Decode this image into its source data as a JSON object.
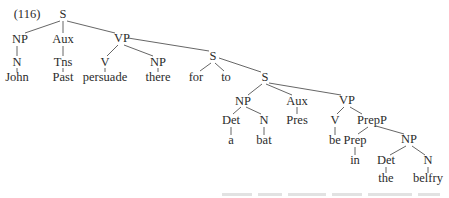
{
  "diagram": {
    "type": "syntax-tree",
    "example_number": "(116)",
    "nodes": [
      {
        "id": "s1",
        "label": "S",
        "x": 63,
        "y": 18
      },
      {
        "id": "np1",
        "label": "NP",
        "x": 20,
        "y": 43
      },
      {
        "id": "aux1",
        "label": "Aux",
        "x": 63,
        "y": 43
      },
      {
        "id": "vp1",
        "label": "VP",
        "x": 122,
        "y": 42
      },
      {
        "id": "n1",
        "label": "N",
        "x": 17,
        "y": 66
      },
      {
        "id": "tns1",
        "label": "Tns",
        "x": 63,
        "y": 66
      },
      {
        "id": "v1",
        "label": "V",
        "x": 105,
        "y": 66
      },
      {
        "id": "np2",
        "label": "NP",
        "x": 158,
        "y": 66
      },
      {
        "id": "s2",
        "label": "S",
        "x": 213,
        "y": 60
      },
      {
        "id": "w_john",
        "label": "John",
        "x": 17,
        "y": 81
      },
      {
        "id": "w_past",
        "label": "Past",
        "x": 63,
        "y": 81
      },
      {
        "id": "w_persuade",
        "label": "persuade",
        "x": 105,
        "y": 81
      },
      {
        "id": "w_there",
        "label": "there",
        "x": 158,
        "y": 81
      },
      {
        "id": "w_for",
        "label": "for",
        "x": 196,
        "y": 81
      },
      {
        "id": "w_to",
        "label": "to",
        "x": 226,
        "y": 81
      },
      {
        "id": "s3",
        "label": "S",
        "x": 265,
        "y": 81
      },
      {
        "id": "np3",
        "label": "NP",
        "x": 243,
        "y": 105
      },
      {
        "id": "aux2",
        "label": "Aux",
        "x": 297,
        "y": 105
      },
      {
        "id": "vp2",
        "label": "VP",
        "x": 347,
        "y": 104
      },
      {
        "id": "det1",
        "label": "Det",
        "x": 231,
        "y": 124
      },
      {
        "id": "n2",
        "label": "N",
        "x": 264,
        "y": 124
      },
      {
        "id": "w_pres",
        "label": "Pres",
        "x": 297,
        "y": 124
      },
      {
        "id": "v2",
        "label": "V",
        "x": 335,
        "y": 124
      },
      {
        "id": "prepp",
        "label": "PrepP",
        "x": 372,
        "y": 124
      },
      {
        "id": "w_a",
        "label": "a",
        "x": 231,
        "y": 144
      },
      {
        "id": "w_bat",
        "label": "bat",
        "x": 264,
        "y": 144
      },
      {
        "id": "w_be",
        "label": "be",
        "x": 335,
        "y": 144
      },
      {
        "id": "prep",
        "label": "Prep",
        "x": 355,
        "y": 144
      },
      {
        "id": "np4",
        "label": "NP",
        "x": 409,
        "y": 143
      },
      {
        "id": "w_in",
        "label": "in",
        "x": 355,
        "y": 164
      },
      {
        "id": "det2",
        "label": "Det",
        "x": 386,
        "y": 164
      },
      {
        "id": "n3",
        "label": "N",
        "x": 428,
        "y": 164
      },
      {
        "id": "w_the",
        "label": "the",
        "x": 386,
        "y": 182
      },
      {
        "id": "w_belfry",
        "label": "belfry",
        "x": 428,
        "y": 182
      }
    ],
    "edges": [
      {
        "from": "s1",
        "to": "np1",
        "x1": 60,
        "y1": 21,
        "x2": 25,
        "y2": 33
      },
      {
        "from": "s1",
        "to": "aux1",
        "x1": 63,
        "y1": 21,
        "x2": 63,
        "y2": 33
      },
      {
        "from": "s1",
        "to": "vp1",
        "x1": 67,
        "y1": 21,
        "x2": 115,
        "y2": 33
      },
      {
        "from": "np1",
        "to": "n1",
        "x1": 17,
        "y1": 46,
        "x2": 17,
        "y2": 56
      },
      {
        "from": "aux1",
        "to": "tns1",
        "x1": 63,
        "y1": 46,
        "x2": 63,
        "y2": 56
      },
      {
        "from": "vp1",
        "to": "v1",
        "x1": 118,
        "y1": 45,
        "x2": 107,
        "y2": 56
      },
      {
        "from": "vp1",
        "to": "np2",
        "x1": 124,
        "y1": 45,
        "x2": 153,
        "y2": 56
      },
      {
        "from": "vp1",
        "to": "s2",
        "x1": 128,
        "y1": 38,
        "x2": 209,
        "y2": 51
      },
      {
        "from": "n1",
        "to": "w_john",
        "x1": 17,
        "y1": 68,
        "x2": 17,
        "y2": 72
      },
      {
        "from": "tns1",
        "to": "w_past",
        "x1": 63,
        "y1": 68,
        "x2": 63,
        "y2": 72
      },
      {
        "from": "v1",
        "to": "w_persuade",
        "x1": 105,
        "y1": 68,
        "x2": 105,
        "y2": 72
      },
      {
        "from": "np2",
        "to": "w_there",
        "x1": 158,
        "y1": 68,
        "x2": 158,
        "y2": 72
      },
      {
        "from": "s2",
        "to": "w_for",
        "x1": 211,
        "y1": 63,
        "x2": 200,
        "y2": 71
      },
      {
        "from": "s2",
        "to": "w_to",
        "x1": 215,
        "y1": 63,
        "x2": 224,
        "y2": 71
      },
      {
        "from": "s2",
        "to": "s3",
        "x1": 219,
        "y1": 58,
        "x2": 261,
        "y2": 72
      },
      {
        "from": "s3",
        "to": "np3",
        "x1": 262,
        "y1": 84,
        "x2": 248,
        "y2": 95
      },
      {
        "from": "s3",
        "to": "aux2",
        "x1": 266,
        "y1": 84,
        "x2": 292,
        "y2": 95
      },
      {
        "from": "s3",
        "to": "vp2",
        "x1": 269,
        "y1": 83,
        "x2": 341,
        "y2": 95
      },
      {
        "from": "np3",
        "to": "det1",
        "x1": 241,
        "y1": 107,
        "x2": 233,
        "y2": 114
      },
      {
        "from": "np3",
        "to": "n2",
        "x1": 246,
        "y1": 107,
        "x2": 261,
        "y2": 114
      },
      {
        "from": "aux2",
        "to": "w_pres",
        "x1": 297,
        "y1": 107,
        "x2": 297,
        "y2": 114
      },
      {
        "from": "vp2",
        "to": "v2",
        "x1": 344,
        "y1": 107,
        "x2": 337,
        "y2": 114
      },
      {
        "from": "vp2",
        "to": "prepp",
        "x1": 350,
        "y1": 107,
        "x2": 362,
        "y2": 114
      },
      {
        "from": "det1",
        "to": "w_a",
        "x1": 231,
        "y1": 127,
        "x2": 231,
        "y2": 135
      },
      {
        "from": "n2",
        "to": "w_bat",
        "x1": 264,
        "y1": 127,
        "x2": 264,
        "y2": 135
      },
      {
        "from": "v2",
        "to": "w_be",
        "x1": 335,
        "y1": 127,
        "x2": 335,
        "y2": 135
      },
      {
        "from": "prepp",
        "to": "prep",
        "x1": 368,
        "y1": 127,
        "x2": 358,
        "y2": 134
      },
      {
        "from": "prepp",
        "to": "np4",
        "x1": 376,
        "y1": 126,
        "x2": 404,
        "y2": 134
      },
      {
        "from": "prep",
        "to": "w_in",
        "x1": 355,
        "y1": 147,
        "x2": 355,
        "y2": 155
      },
      {
        "from": "np4",
        "to": "det2",
        "x1": 406,
        "y1": 146,
        "x2": 390,
        "y2": 155
      },
      {
        "from": "np4",
        "to": "n3",
        "x1": 412,
        "y1": 146,
        "x2": 425,
        "y2": 155
      },
      {
        "from": "det2",
        "to": "w_the",
        "x1": 386,
        "y1": 167,
        "x2": 386,
        "y2": 173
      },
      {
        "from": "n3",
        "to": "w_belfry",
        "x1": 428,
        "y1": 167,
        "x2": 428,
        "y2": 173
      }
    ],
    "bottom_clipped_line": "illegible (cut off at image edge)"
  }
}
